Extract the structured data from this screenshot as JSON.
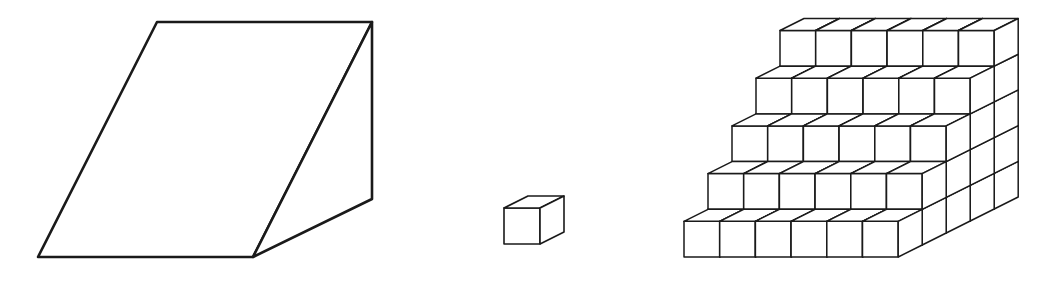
{
  "figure": {
    "stroke_color": "#1a1a1a",
    "background": "#ffffff",
    "wedge": {
      "points": {
        "top_left": [
          157,
          22
        ],
        "top_right": [
          372,
          22
        ],
        "bottom_left": [
          38,
          257
        ],
        "bottom_mid": [
          253,
          257
        ],
        "side_bottom": [
          372,
          199
        ]
      },
      "stroke_width": 2.6
    },
    "unit_cube": {
      "origin": [
        504,
        244
      ],
      "size": 36,
      "depth": [
        24,
        -12
      ],
      "stroke_width": 1.6
    },
    "staircase": {
      "rows": 5,
      "cubes_per_row": 6,
      "origin": [
        684,
        257
      ],
      "size": 35.7,
      "depth": [
        24,
        -12
      ],
      "layer_depth_counts": [
        5,
        4,
        3,
        2,
        1
      ],
      "stroke_width": 1.5
    }
  }
}
